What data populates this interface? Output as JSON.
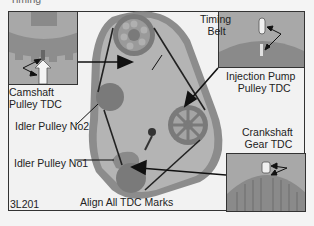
{
  "figure": {
    "header_fragment": "Timing",
    "id_code": "3L201",
    "caption": "Align All TDC Marks"
  },
  "labels": {
    "timing_belt": [
      "Timing",
      "Belt"
    ],
    "camshaft": [
      "Camshaft",
      "Pulley TDC"
    ],
    "injection_pump": [
      "Injection Pump",
      "Pulley TDC"
    ],
    "idler_no2": "Idler Pulley No2",
    "idler_no1": "Idler Pulley No1",
    "crankshaft": [
      "Crankshaft",
      "Gear TDC"
    ]
  },
  "colors": {
    "housing": "#8c8c8c",
    "housing_inner": "#b4b4b4",
    "gear": "#7a7a7a",
    "belt": "#222222",
    "inset_bg": "#a8a8a8",
    "border": "#333333"
  }
}
